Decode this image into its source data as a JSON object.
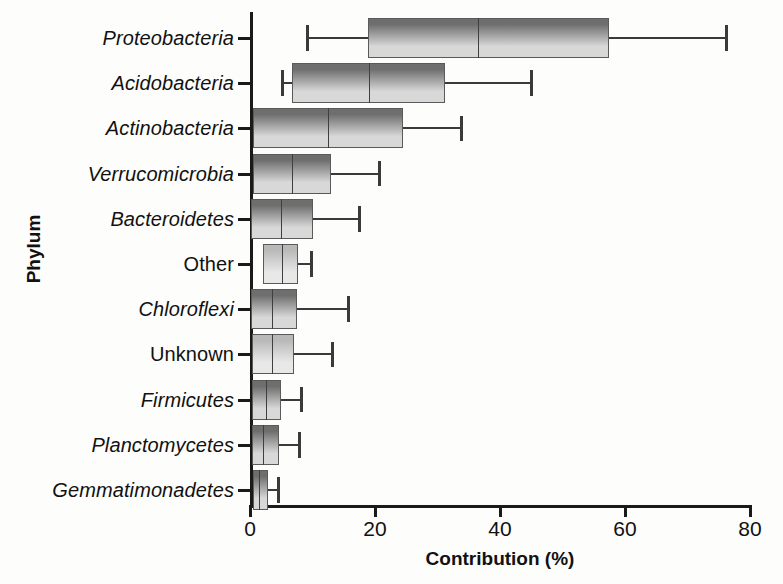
{
  "chart_data": {
    "type": "box",
    "title": "",
    "xlabel": "Contribution (%)",
    "ylabel": "Phylum",
    "xlim": [
      0,
      80
    ],
    "xticks": [
      "0",
      "20",
      "40",
      "60",
      "80"
    ],
    "xtick_values": [
      0,
      20,
      40,
      60,
      80
    ],
    "grid": false,
    "legend": "none",
    "orientation": "horizontal",
    "categories": [
      "Proteobacteria",
      "Acidobacteria",
      "Actinobacteria",
      "Verrucomicrobia",
      "Bacteroidetes",
      "Other",
      "Chloroflexi",
      "Unknown",
      "Firmicutes",
      "Planctomycetes",
      "Gemmatimonadetes"
    ],
    "boxes": [
      {
        "category": "Proteobacteria",
        "italic": true,
        "whisker_low": 9.0,
        "q1": 18.8,
        "median": 36.5,
        "q3": 57.5,
        "whisker_high": 76.0,
        "shade": "dark"
      },
      {
        "category": "Acidobacteria",
        "italic": true,
        "whisker_low": 5.0,
        "q1": 6.7,
        "median": 19.0,
        "q3": 31.2,
        "whisker_high": 44.8,
        "shade": "dark"
      },
      {
        "category": "Actinobacteria",
        "italic": true,
        "whisker_low": 0.5,
        "q1": 0.5,
        "median": 12.5,
        "q3": 24.5,
        "whisker_high": 33.6,
        "shade": "dark"
      },
      {
        "category": "Verrucomicrobia",
        "italic": true,
        "whisker_low": 0.4,
        "q1": 0.4,
        "median": 6.7,
        "q3": 13.0,
        "whisker_high": 20.5,
        "shade": "dark"
      },
      {
        "category": "Bacteroidetes",
        "italic": true,
        "whisker_low": 0.2,
        "q1": 0.2,
        "median": 5.0,
        "q3": 10.0,
        "whisker_high": 17.3,
        "shade": "dark"
      },
      {
        "category": "Other",
        "italic": false,
        "whisker_low": 2.1,
        "q1": 2.1,
        "median": 5.1,
        "q3": 7.7,
        "whisker_high": 9.6,
        "shade": "light"
      },
      {
        "category": "Chloroflexi",
        "italic": true,
        "whisker_low": 0.2,
        "q1": 0.2,
        "median": 3.5,
        "q3": 7.5,
        "whisker_high": 15.5,
        "shade": "dark"
      },
      {
        "category": "Unknown",
        "italic": false,
        "whisker_low": 0.3,
        "q1": 0.3,
        "median": 3.5,
        "q3": 7.0,
        "whisker_high": 13.0,
        "shade": "light"
      },
      {
        "category": "Firmicutes",
        "italic": true,
        "whisker_low": 0.3,
        "q1": 0.3,
        "median": 2.5,
        "q3": 5.0,
        "whisker_high": 8.0,
        "shade": "dark"
      },
      {
        "category": "Planctomycetes",
        "italic": true,
        "whisker_low": 0.3,
        "q1": 0.3,
        "median": 2.1,
        "q3": 4.7,
        "whisker_high": 7.7,
        "shade": "dark"
      },
      {
        "category": "Gemmatimonadetes",
        "italic": true,
        "whisker_low": 0.4,
        "q1": 0.4,
        "median": 1.4,
        "q3": 2.9,
        "whisker_high": 4.3,
        "shade": "dark"
      }
    ],
    "colors": {
      "axis": "#1a1a1a",
      "box_dark_top": "#6e6e6e",
      "box_dark_bottom": "#d8d8d8",
      "box_light_top": "#b9b9b9",
      "box_light_bottom": "#e8e8e8",
      "whisker": "#3a3a3a",
      "text": "#111111"
    }
  }
}
